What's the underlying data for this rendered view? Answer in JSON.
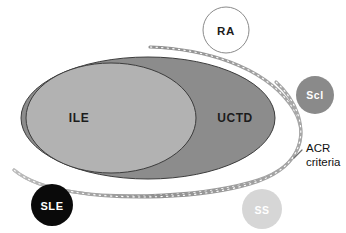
{
  "figure": {
    "type": "venn-diagram",
    "background_color": "#ffffff",
    "width": 346,
    "height": 233
  },
  "sets": {
    "ile": {
      "label": "ILE",
      "fill_color": "#b2b2b2",
      "stroke_color": "#3c3c3c",
      "label_color": "#1c1c1c",
      "shape": "ellipse",
      "cx": 111,
      "cy": 118,
      "rx": 85,
      "ry": 55,
      "label_x": 79,
      "label_y": 122
    },
    "uctd": {
      "label": "UCTD",
      "fill_color": "#8c8c8c",
      "stroke_color": "#3c3c3c",
      "label_color": "#1c1c1c",
      "shape": "ellipse",
      "cx": 148,
      "cy": 118,
      "rx": 127,
      "ry": 61,
      "label_x": 235,
      "label_y": 122
    }
  },
  "nodes": [
    {
      "id": "ra",
      "label": "RA",
      "fill_color": "#ffffff",
      "stroke_color": "#8a8a8a",
      "label_color": "#1c1c1c",
      "cx": 226,
      "cy": 30,
      "r": 23
    },
    {
      "id": "scl",
      "label": "Scl",
      "fill_color": "#8a8a8a",
      "stroke_color": "none",
      "label_color": "#ffffff",
      "cx": 315,
      "cy": 95,
      "r": 19
    },
    {
      "id": "sle",
      "label": "SLE",
      "fill_color": "#0a0a0a",
      "stroke_color": "none",
      "label_color": "#ffffff",
      "cx": 52,
      "cy": 205,
      "r": 21
    },
    {
      "id": "ss",
      "label": "SS",
      "fill_color": "#d6d6d6",
      "stroke_color": "none",
      "label_color": "#ffffff",
      "cx": 262,
      "cy": 209,
      "r": 20
    }
  ],
  "annotation": {
    "line1": "ACR",
    "line2": "criteria",
    "text_color": "#111111",
    "curve_color": "#9a9a9a",
    "label_x": 306,
    "label_y1": 152,
    "label_y2": 166
  }
}
